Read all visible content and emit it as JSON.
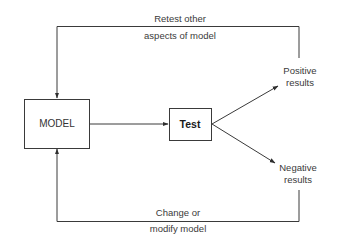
{
  "diagram": {
    "type": "flowchart",
    "nodes": {
      "model": {
        "label": "MODEL"
      },
      "test": {
        "label": "Test"
      },
      "positive": {
        "line1": "Positive",
        "line2": "results"
      },
      "negative": {
        "line1": "Negative",
        "line2": "results"
      }
    },
    "edges": {
      "model_to_test": {
        "from": "MODEL",
        "to": "Test"
      },
      "test_to_positive": {
        "from": "Test",
        "to": "Positive results"
      },
      "test_to_negative": {
        "from": "Test",
        "to": "Negative results"
      },
      "positive_to_model": {
        "from": "Positive results",
        "to": "MODEL",
        "line1": "Retest other",
        "line2": "aspects of model"
      },
      "negative_to_model": {
        "from": "Negative results",
        "to": "MODEL",
        "line1": "Change or",
        "line2": "modify model"
      }
    },
    "colors": {
      "line": "#3a3a3a",
      "text": "#3a3a3a",
      "background": "#ffffff"
    }
  }
}
